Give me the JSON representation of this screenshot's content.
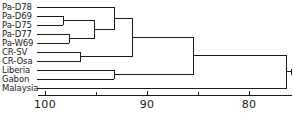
{
  "figure": {
    "type": "dendrogram",
    "background_color": "#ffffff",
    "line_color": "#1a1a1a",
    "text_color": "#1a1a1a"
  },
  "axis": {
    "orientation": "horizontal-bottom",
    "direction": "decreasing-left-to-right",
    "tick_labels": [
      "100",
      "90",
      "80"
    ],
    "tick_values": [
      100,
      90,
      80
    ],
    "minor_tick_values": [
      95,
      85,
      75
    ],
    "range_left": 101.2,
    "range_right": 75.6,
    "title": ""
  },
  "leaves": [
    {
      "label": "Pa-D78"
    },
    {
      "label": "Pa-D69"
    },
    {
      "label": "Pa-D75"
    },
    {
      "label": "Pa-D77"
    },
    {
      "label": "Pa-W69"
    },
    {
      "label": "CR-SV"
    },
    {
      "label": "CR-Osa"
    },
    {
      "label": "Liberia"
    },
    {
      "label": "Gabon"
    },
    {
      "label": "Malaysia"
    }
  ],
  "chart_data": {
    "type": "dendrogram",
    "title": "",
    "xlabel": "",
    "ylabel": "",
    "xlim": [
      101.2,
      75.6
    ],
    "grid": false,
    "legend": null,
    "axis_ticks": [
      100,
      90,
      80
    ],
    "axis_minor_ticks": [
      95,
      85,
      75
    ],
    "leaf_order": [
      "Pa-D78",
      "Pa-D69",
      "Pa-D75",
      "Pa-D77",
      "Pa-W69",
      "CR-SV",
      "CR-Osa",
      "Liberia",
      "Gabon",
      "Malaysia"
    ],
    "leaf_similarity_start": 100.8,
    "merges": [
      {
        "id": "n1",
        "children": [
          "Pa-D69",
          "Pa-D75"
        ],
        "similarity": 98.2
      },
      {
        "id": "n2",
        "children": [
          "Pa-D77",
          "Pa-W69"
        ],
        "similarity": 97.6
      },
      {
        "id": "n3",
        "children": [
          "CR-SV",
          "CR-Osa"
        ],
        "similarity": 96.5
      },
      {
        "id": "n4",
        "children": [
          "n1",
          "n2"
        ],
        "similarity": 95.1
      },
      {
        "id": "n5",
        "children": [
          "Pa-D78",
          "n4"
        ],
        "similarity": 93.2
      },
      {
        "id": "n6",
        "children": [
          "Liberia",
          "Gabon"
        ],
        "similarity": 93.2
      },
      {
        "id": "n7",
        "children": [
          "n5",
          "n3"
        ],
        "similarity": 91.4
      },
      {
        "id": "n8",
        "children": [
          "n7",
          "n6"
        ],
        "similarity": 85.4
      },
      {
        "id": "n9",
        "children": [
          "n8",
          "Malaysia"
        ],
        "similarity": 76.3
      }
    ]
  }
}
